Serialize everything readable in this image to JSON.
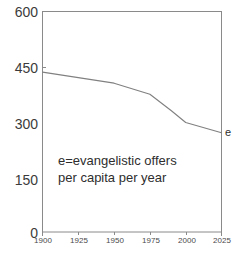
{
  "chart_data": {
    "type": "line",
    "title": "",
    "subtitle": "",
    "xlabel": "",
    "ylabel": "",
    "xlim": [
      1900,
      2025
    ],
    "ylim": [
      0,
      600
    ],
    "grid": false,
    "legend_position": "right-edge-inline",
    "x_ticks": [
      "1900",
      "1925",
      "1950",
      "1975",
      "2000",
      "2025"
    ],
    "y_ticks": [
      "0",
      "150",
      "300",
      "450",
      "600"
    ],
    "annotations": [
      {
        "name": "definition-note",
        "line1": "e=evangelistic offers",
        "line2": "per capita per year"
      }
    ],
    "series": [
      {
        "name": "e",
        "label": "e",
        "color": "#808080",
        "x": [
          1900,
          1925,
          1950,
          1975,
          1990,
          2000,
          2025
        ],
        "values": [
          435,
          420,
          405,
          375,
          330,
          298,
          270
        ]
      }
    ]
  },
  "axes": {
    "y_tick_labels": [
      "600",
      "450",
      "300",
      "150",
      "0"
    ],
    "x_tick_labels": [
      "1900",
      "1925",
      "1950",
      "1975",
      "2000",
      "2025"
    ]
  },
  "note": {
    "line1": "e=evangelistic offers",
    "line2": "per capita per year"
  },
  "series_end_label": "e",
  "colors": {
    "line": "#808080",
    "frame": "#8a8a8a",
    "text": "#3b3b3b",
    "background": "#ffffff"
  }
}
